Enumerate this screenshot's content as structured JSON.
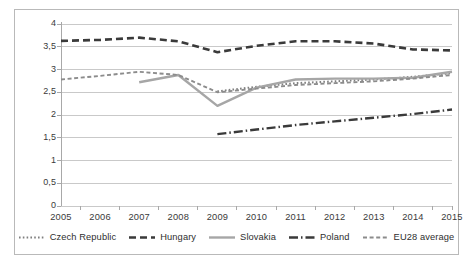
{
  "chart_data": {
    "type": "line",
    "title": "",
    "subtitle": "",
    "xlabel": "",
    "ylabel": "",
    "grid": true,
    "legend_position": "bottom",
    "decimal_separator": ",",
    "x": [
      2005,
      2006,
      2007,
      2008,
      2009,
      2010,
      2011,
      2012,
      2013,
      2014,
      2015
    ],
    "categories": [
      "2005",
      "2006",
      "2007",
      "2008",
      "2009",
      "2010",
      "2011",
      "2012",
      "2013",
      "2014",
      "2015"
    ],
    "xlim": [
      2005,
      2015
    ],
    "ylim": [
      0,
      4
    ],
    "yticks": [
      0,
      0.5,
      1,
      1.5,
      2,
      2.5,
      3,
      3.5,
      4
    ],
    "ytick_labels": [
      "0",
      "0,5",
      "1",
      "1,5",
      "2",
      "2,5",
      "3",
      "3,5",
      "4"
    ],
    "series": [
      {
        "name": "Czech Republic",
        "style": "dotted",
        "color": "#808080",
        "values": [
          null,
          null,
          null,
          null,
          2.52,
          2.62,
          2.7,
          2.74,
          2.78,
          2.84,
          2.92
        ]
      },
      {
        "name": "Hungary",
        "style": "dashed",
        "color": "#3a3a3a",
        "values": [
          3.63,
          3.65,
          3.7,
          3.62,
          3.38,
          3.52,
          3.62,
          3.62,
          3.57,
          3.44,
          3.42
        ]
      },
      {
        "name": "Slovakia",
        "style": "solid",
        "color": "#a6a6a6",
        "values": [
          null,
          null,
          2.72,
          2.88,
          2.2,
          2.6,
          2.78,
          2.8,
          2.8,
          2.82,
          2.95
        ]
      },
      {
        "name": "Poland",
        "style": "dashdot",
        "color": "#3a3a3a",
        "values": [
          null,
          null,
          null,
          null,
          1.58,
          1.68,
          1.78,
          1.86,
          1.94,
          2.02,
          2.12
        ]
      },
      {
        "name": "EU28 average",
        "style": "dashed-light",
        "color": "#8c8c8c",
        "values": [
          2.78,
          2.86,
          2.95,
          2.88,
          2.5,
          2.58,
          2.66,
          2.7,
          2.74,
          2.8,
          2.88
        ]
      }
    ]
  },
  "legend": {
    "items": [
      {
        "label": "Czech Republic",
        "swatch": "dotted-swatch"
      },
      {
        "label": "Hungary",
        "swatch": "dashed-swatch"
      },
      {
        "label": "Slovakia",
        "swatch": "solid-swatch"
      },
      {
        "label": "Poland",
        "swatch": "dashdot-swatch"
      },
      {
        "label": "EU28 average",
        "swatch": "dashed-light-swatch"
      }
    ]
  },
  "axes": {
    "y_labels": [
      "4",
      "3,5",
      "3",
      "2,5",
      "2",
      "1,5",
      "1",
      "0,5",
      "0"
    ],
    "x_labels": [
      "2005",
      "2006",
      "2007",
      "2008",
      "2009",
      "2010",
      "2011",
      "2012",
      "2013",
      "2014",
      "2015"
    ]
  },
  "colors": {
    "frame": "#b9b9b9",
    "grid": "#c9c9c9",
    "axis": "#a8a8a8",
    "text": "#3a3a3a",
    "slovakia": "#a6a6a6",
    "hungary": "#3a3a3a",
    "eu28": "#8c8c8c",
    "czech": "#808080",
    "poland": "#3a3a3a"
  }
}
